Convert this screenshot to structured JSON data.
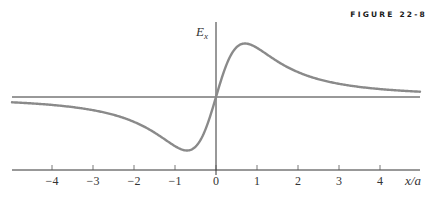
{
  "figure": {
    "label": "FIGURE 22-8"
  },
  "chart_data": {
    "type": "line",
    "title": "",
    "xlabel": "x/a",
    "ylabel": "E_x",
    "xlim": [
      -5,
      5
    ],
    "xticks": [
      -4,
      -3,
      -2,
      -1,
      0,
      1,
      2,
      3,
      4
    ],
    "tick_labels": [
      "−4",
      "−3",
      "−2",
      "−1",
      "0",
      "1",
      "2",
      "3",
      "4"
    ],
    "grid": false,
    "legend": null,
    "function": "E_x ∝ (x/a) / ((x/a)^2 + 1)^(3/2)",
    "series": [
      {
        "name": "E_x",
        "color": "#8a8a8a",
        "x": [
          -5,
          -4,
          -3,
          -2,
          -1.5,
          -1,
          -0.707,
          -0.5,
          0,
          0.5,
          0.707,
          1,
          1.5,
          2,
          3,
          4,
          5
        ],
        "y": [
          -0.038,
          -0.057,
          -0.095,
          -0.179,
          -0.256,
          -0.354,
          -0.385,
          -0.358,
          0,
          0.358,
          0.385,
          0.354,
          0.256,
          0.179,
          0.095,
          0.057,
          0.038
        ]
      }
    ],
    "annotations": [
      {
        "text": "maximum near x/a ≈ 0.71"
      },
      {
        "text": "minimum near x/a ≈ −0.71"
      }
    ]
  },
  "colors": {
    "curve": "#8a8a8a",
    "axes": "#333333",
    "background": "#ffffff"
  }
}
